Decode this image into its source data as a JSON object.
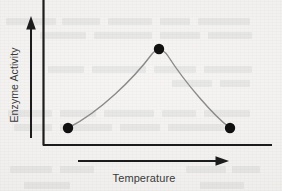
{
  "figure": {
    "background_color": "#f3f2f0",
    "ink_color": "#1c1c1c",
    "curve_color": "#8a8a8a",
    "label_color": "#3a3a3a"
  },
  "axes": {
    "y_axis_label": "Enzyme Activity",
    "x_axis_label": "Temperature",
    "y_axis_arrow_direction": "up",
    "x_axis_arrow_direction": "right",
    "ticks_shown": false,
    "tick_labels": [],
    "gridlines": false
  },
  "chart_data": {
    "type": "line",
    "title": "",
    "subtitle": "",
    "xlabel": "Temperature",
    "ylabel": "Enzyme Activity",
    "xlim": [
      0,
      1
    ],
    "ylim": [
      0,
      1
    ],
    "grid": false,
    "legend": false,
    "legend_position": "none",
    "axis_ticks": "none",
    "annotations": [],
    "marker_style": "filled-circle",
    "marker_color": "#101010",
    "line_color": "#8a8a8a",
    "series": [
      {
        "name": "Enzyme activity",
        "marked_points": [
          {
            "label": "low temperature",
            "x": 0.11,
            "y": 0.12
          },
          {
            "label": "optimum temperature",
            "x": 0.51,
            "y": 0.67
          },
          {
            "label": "high temperature",
            "x": 0.82,
            "y": 0.12
          }
        ],
        "x": [
          0.11,
          0.2,
          0.3,
          0.4,
          0.46,
          0.51,
          0.57,
          0.63,
          0.7,
          0.76,
          0.82
        ],
        "values": [
          0.12,
          0.23,
          0.38,
          0.54,
          0.62,
          0.67,
          0.65,
          0.57,
          0.42,
          0.26,
          0.12
        ]
      }
    ]
  },
  "ghost_text_lines": [
    {
      "x": 6,
      "y": 18,
      "w": 50
    },
    {
      "x": 62,
      "y": 18,
      "w": 38
    },
    {
      "x": 108,
      "y": 18,
      "w": 44
    },
    {
      "x": 160,
      "y": 18,
      "w": 30
    },
    {
      "x": 198,
      "y": 18,
      "w": 52
    },
    {
      "x": 40,
      "y": 32,
      "w": 46
    },
    {
      "x": 94,
      "y": 32,
      "w": 58
    },
    {
      "x": 160,
      "y": 32,
      "w": 40
    },
    {
      "x": 208,
      "y": 32,
      "w": 44
    },
    {
      "x": 48,
      "y": 66,
      "w": 36
    },
    {
      "x": 92,
      "y": 66,
      "w": 54
    },
    {
      "x": 154,
      "y": 66,
      "w": 42
    },
    {
      "x": 204,
      "y": 66,
      "w": 48
    },
    {
      "x": 172,
      "y": 80,
      "w": 40
    },
    {
      "x": 220,
      "y": 80,
      "w": 30
    },
    {
      "x": 8,
      "y": 110,
      "w": 44
    },
    {
      "x": 60,
      "y": 110,
      "w": 36
    },
    {
      "x": 104,
      "y": 110,
      "w": 50
    },
    {
      "x": 162,
      "y": 110,
      "w": 34
    },
    {
      "x": 204,
      "y": 110,
      "w": 46
    },
    {
      "x": 14,
      "y": 124,
      "w": 38
    },
    {
      "x": 60,
      "y": 124,
      "w": 52
    },
    {
      "x": 120,
      "y": 124,
      "w": 40
    },
    {
      "x": 168,
      "y": 124,
      "w": 56
    },
    {
      "x": 10,
      "y": 166,
      "w": 42
    },
    {
      "x": 60,
      "y": 166,
      "w": 34
    },
    {
      "x": 186,
      "y": 166,
      "w": 40
    },
    {
      "x": 232,
      "y": 166,
      "w": 28
    },
    {
      "x": 24,
      "y": 182,
      "w": 46
    },
    {
      "x": 200,
      "y": 182,
      "w": 44
    }
  ]
}
